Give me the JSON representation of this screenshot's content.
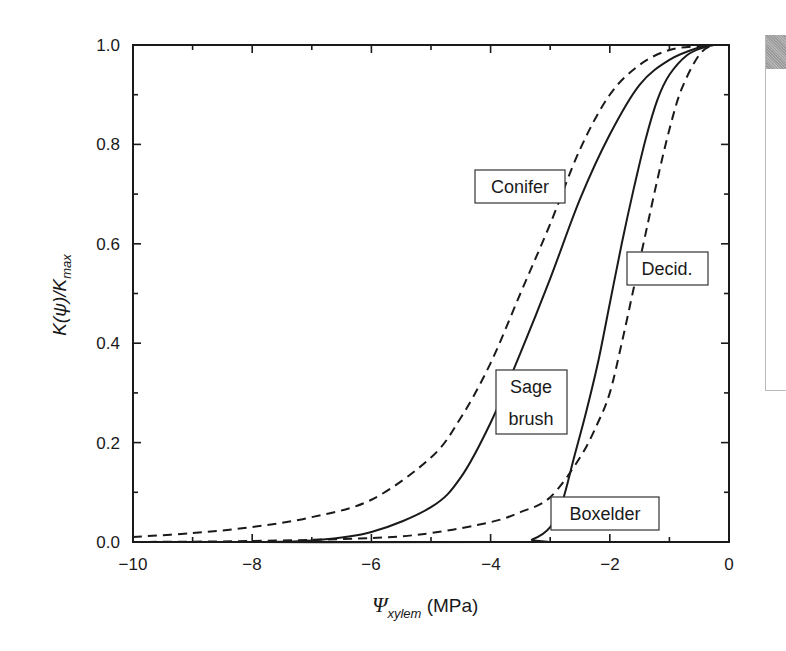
{
  "chart_data": {
    "type": "line",
    "title": "",
    "xlabel": "Ψ_xylem (MPa)",
    "xlabel_main": "Ψ",
    "xlabel_sub": "xylem",
    "xlabel_unit": "(MPa)",
    "ylabel": "K(ψ)/K_max",
    "ylabel_main": "K(ψ)/K",
    "ylabel_sub": "max",
    "xlim": [
      -10,
      0
    ],
    "ylim": [
      0.0,
      1.0
    ],
    "x_ticks": [
      -10,
      -8,
      -6,
      -4,
      -2,
      0
    ],
    "x_tick_labels": [
      "−10",
      "−8",
      "−6",
      "−4",
      "−2",
      "0"
    ],
    "y_ticks": [
      0.0,
      0.2,
      0.4,
      0.6,
      0.8,
      1.0
    ],
    "y_tick_labels": [
      "0.0",
      "0.2",
      "0.4",
      "0.6",
      "0.8",
      "1.0"
    ],
    "grid": false,
    "legend": "none (inline boxed labels)",
    "series": [
      {
        "name": "Conifer",
        "style": "dashed",
        "label_box": {
          "x": -4.3,
          "y": 0.74
        },
        "x": [
          -10,
          -9,
          -8,
          -7,
          -6,
          -5,
          -4.5,
          -4,
          -3.5,
          -3,
          -2.5,
          -2,
          -1.5,
          -1,
          -0.5,
          -0.25
        ],
        "y": [
          0.01,
          0.018,
          0.03,
          0.05,
          0.085,
          0.17,
          0.25,
          0.36,
          0.5,
          0.64,
          0.79,
          0.9,
          0.96,
          0.99,
          0.998,
          1.0
        ]
      },
      {
        "name": "Sage brush",
        "style": "solid",
        "label_box": {
          "x": -3.9,
          "y": 0.3
        },
        "x": [
          -10,
          -8,
          -7,
          -6,
          -5,
          -4.5,
          -4,
          -3.5,
          -3,
          -2.5,
          -2,
          -1.5,
          -1,
          -0.5,
          -0.25
        ],
        "y": [
          0.0,
          0.0,
          0.003,
          0.02,
          0.07,
          0.13,
          0.24,
          0.38,
          0.53,
          0.69,
          0.82,
          0.92,
          0.97,
          0.995,
          1.0
        ]
      },
      {
        "name": "Decid.",
        "style": "dashed",
        "label_box": {
          "x": -1.4,
          "y": 0.55
        },
        "x": [
          -10,
          -8,
          -6,
          -5,
          -4,
          -3.5,
          -3,
          -2.5,
          -2.2,
          -2,
          -1.8,
          -1.6,
          -1.4,
          -1.2,
          -1,
          -0.8,
          -0.5,
          -0.25
        ],
        "y": [
          0.0,
          0.002,
          0.008,
          0.018,
          0.04,
          0.06,
          0.09,
          0.17,
          0.24,
          0.3,
          0.4,
          0.51,
          0.62,
          0.73,
          0.83,
          0.91,
          0.98,
          1.0
        ]
      },
      {
        "name": "Boxelder",
        "style": "solid",
        "label_box": {
          "x": -2.9,
          "y": 0.04
        },
        "x": [
          -10,
          -3.6,
          -3.3,
          -3.0,
          -2.8,
          -2.6,
          -2.4,
          -2.2,
          -2.0,
          -1.8,
          -1.6,
          -1.4,
          -1.2,
          -1.0,
          -0.7,
          -0.4,
          -0.25
        ],
        "y": [
          0.0,
          0.0,
          0.005,
          0.03,
          0.08,
          0.17,
          0.26,
          0.36,
          0.48,
          0.6,
          0.71,
          0.81,
          0.89,
          0.94,
          0.98,
          0.996,
          1.0
        ]
      }
    ]
  },
  "labels": {
    "conifer": "Conifer",
    "sage_line1": "Sage",
    "sage_line2": "brush",
    "decid": "Decid.",
    "boxelder": "Boxelder"
  },
  "axes": {
    "x_ticks": [
      "−10",
      "−8",
      "−6",
      "−4",
      "−2",
      "0"
    ],
    "y_ticks": [
      "0.0",
      "0.2",
      "0.4",
      "0.6",
      "0.8",
      "1.0"
    ],
    "x_title_main": "Ψ",
    "x_title_sub": "xylem",
    "x_title_unit": " (MPa)",
    "y_title_main": "K(ψ)/K",
    "y_title_sub": "max"
  }
}
